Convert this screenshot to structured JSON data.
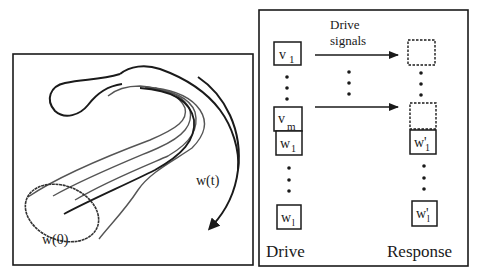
{
  "left_panel": {
    "trajectory_label": "w(t)",
    "initial_label": "w(0)"
  },
  "right_panel": {
    "arrow_label_line1": "Drive",
    "arrow_label_line2": "signals",
    "drive_column_label": "Drive",
    "response_column_label": "Response",
    "drive_boxes": [
      {
        "base": "v",
        "sub": "1"
      },
      {
        "base": "v",
        "sub": "m"
      },
      {
        "base": "w",
        "sub": "1"
      },
      {
        "base": "w",
        "sub": "l"
      }
    ],
    "response_boxes": [
      {
        "base": "w'",
        "sub": "1"
      },
      {
        "base": "w'",
        "sub": "l"
      }
    ]
  },
  "colors": {
    "ink": "#1a1a1a",
    "gray_ink": "#555555",
    "background": "#ffffff"
  }
}
